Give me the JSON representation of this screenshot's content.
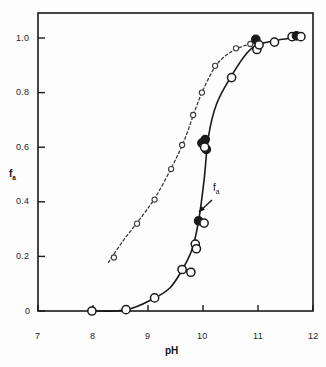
{
  "figure": {
    "background": "#fdfdfd",
    "ink": "#1a1a1a"
  },
  "axes": {
    "x_title": "pH",
    "y_title_base": "f",
    "y_title_sub": "a",
    "x_ticklabels": [
      "7",
      "8",
      "9",
      "10",
      "11",
      "12"
    ],
    "y_ticklabels": [
      "0",
      "0.2",
      "0.4",
      "0.6",
      "0.8",
      "1.0"
    ]
  },
  "annotations": [
    {
      "name": "fa-curve-label",
      "base": "f",
      "sub": "a",
      "x_px": 213,
      "y_px": 188,
      "arrow_from": [
        212,
        200
      ],
      "arrow_to": [
        199,
        212
      ]
    }
  ],
  "chart_data": {
    "type": "scatter",
    "title": "",
    "xlabel": "pH",
    "ylabel": "f_a",
    "xlim": [
      7,
      12
    ],
    "ylim": [
      -0.06,
      1.08
    ],
    "xticks": [
      7,
      8,
      9,
      10,
      11,
      12
    ],
    "yticks": [
      0,
      0.2,
      0.4,
      0.6,
      0.8,
      1.0
    ],
    "grid": false,
    "legend": "none",
    "series": [
      {
        "name": "f_a (solid curve)",
        "linestyle": "solid",
        "marker": "circle-large",
        "color": "#1a1a1a",
        "points": [
          {
            "x": 7.98,
            "y": 0.0,
            "fill": "open"
          },
          {
            "x": 8.6,
            "y": 0.005,
            "fill": "open"
          },
          {
            "x": 9.12,
            "y": 0.048,
            "fill": "open"
          },
          {
            "x": 9.62,
            "y": 0.152,
            "fill": "open"
          },
          {
            "x": 9.78,
            "y": 0.142,
            "fill": "open"
          },
          {
            "x": 9.86,
            "y": 0.245,
            "fill": "open"
          },
          {
            "x": 9.88,
            "y": 0.228,
            "fill": "open"
          },
          {
            "x": 9.92,
            "y": 0.33,
            "fill": "filled"
          },
          {
            "x": 10.02,
            "y": 0.322,
            "fill": "open"
          },
          {
            "x": 9.98,
            "y": 0.615,
            "fill": "filled"
          },
          {
            "x": 10.04,
            "y": 0.628,
            "fill": "filled"
          },
          {
            "x": 10.06,
            "y": 0.592,
            "fill": "filled"
          },
          {
            "x": 10.03,
            "y": 0.6,
            "fill": "open"
          },
          {
            "x": 10.52,
            "y": 0.855,
            "fill": "open"
          },
          {
            "x": 10.96,
            "y": 0.995,
            "fill": "filled"
          },
          {
            "x": 10.98,
            "y": 0.958,
            "fill": "open"
          },
          {
            "x": 11.02,
            "y": 0.975,
            "fill": "open"
          },
          {
            "x": 11.3,
            "y": 0.985,
            "fill": "open"
          },
          {
            "x": 11.62,
            "y": 1.005,
            "fill": "open"
          },
          {
            "x": 11.7,
            "y": 1.008,
            "fill": "filled"
          },
          {
            "x": 11.78,
            "y": 1.005,
            "fill": "open"
          }
        ],
        "curve": [
          {
            "x": 7.95,
            "y": 0.0
          },
          {
            "x": 8.6,
            "y": 0.004
          },
          {
            "x": 9.1,
            "y": 0.045
          },
          {
            "x": 9.4,
            "y": 0.085
          },
          {
            "x": 9.62,
            "y": 0.15
          },
          {
            "x": 9.8,
            "y": 0.225
          },
          {
            "x": 9.92,
            "y": 0.33
          },
          {
            "x": 10.02,
            "y": 0.48
          },
          {
            "x": 10.1,
            "y": 0.64
          },
          {
            "x": 10.25,
            "y": 0.76
          },
          {
            "x": 10.52,
            "y": 0.862
          },
          {
            "x": 10.8,
            "y": 0.945
          },
          {
            "x": 11.0,
            "y": 0.975
          },
          {
            "x": 11.35,
            "y": 0.992
          },
          {
            "x": 11.8,
            "y": 1.005
          }
        ]
      },
      {
        "name": "reference (dashed curve)",
        "linestyle": "dashed",
        "marker": "circle-small",
        "color": "#3a3a3a",
        "points": [
          {
            "x": 8.38,
            "y": 0.196,
            "fill": "open"
          },
          {
            "x": 8.8,
            "y": 0.32,
            "fill": "open"
          },
          {
            "x": 9.12,
            "y": 0.408,
            "fill": "open"
          },
          {
            "x": 9.42,
            "y": 0.52,
            "fill": "open"
          },
          {
            "x": 9.62,
            "y": 0.608,
            "fill": "open"
          },
          {
            "x": 9.82,
            "y": 0.718,
            "fill": "open"
          },
          {
            "x": 9.98,
            "y": 0.8,
            "fill": "open"
          },
          {
            "x": 10.22,
            "y": 0.898,
            "fill": "open"
          },
          {
            "x": 10.6,
            "y": 0.962,
            "fill": "open"
          },
          {
            "x": 10.86,
            "y": 0.978,
            "fill": "open"
          }
        ],
        "curve": [
          {
            "x": 8.28,
            "y": 0.178
          },
          {
            "x": 8.55,
            "y": 0.258
          },
          {
            "x": 8.82,
            "y": 0.328
          },
          {
            "x": 9.12,
            "y": 0.412
          },
          {
            "x": 9.42,
            "y": 0.522
          },
          {
            "x": 9.66,
            "y": 0.625
          },
          {
            "x": 9.86,
            "y": 0.738
          },
          {
            "x": 10.02,
            "y": 0.818
          },
          {
            "x": 10.24,
            "y": 0.9
          },
          {
            "x": 10.5,
            "y": 0.948
          },
          {
            "x": 10.8,
            "y": 0.975
          },
          {
            "x": 11.0,
            "y": 0.982
          }
        ]
      }
    ]
  }
}
